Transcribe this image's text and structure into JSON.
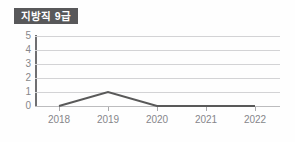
{
  "badge": {
    "label": "지방직 9급",
    "background": "#58585a",
    "text_color": "#ffffff"
  },
  "chart_data": {
    "type": "line",
    "title": "지방직 9급",
    "xlabel": "",
    "ylabel": "",
    "categories": [
      "2018",
      "2019",
      "2020",
      "2021",
      "2022"
    ],
    "values": [
      0,
      1,
      0,
      0,
      0
    ],
    "series": [
      {
        "name": "지방직 9급",
        "values": [
          0,
          1,
          0,
          0,
          0
        ],
        "color": "#595959"
      }
    ],
    "ylim": [
      0,
      5
    ],
    "yticks": [
      5,
      4,
      3,
      2,
      1,
      0
    ],
    "ytick_labels": [
      "5",
      "4",
      "3",
      "2",
      "1",
      "0"
    ],
    "grid": true,
    "grid_axis": "y",
    "grid_color": "#d3d3d5",
    "legend": false,
    "legend_position": "none",
    "markers": false,
    "line_width": 2,
    "axis_color": "#6f6f71",
    "tick_label_color": "#86868a",
    "background": "#fefefe"
  }
}
